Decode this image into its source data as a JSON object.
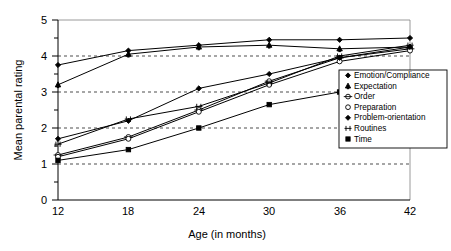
{
  "chart_data": {
    "type": "line",
    "title": "",
    "xlabel": "Age (in months)",
    "ylabel": "Mean parental rating",
    "categories": [
      12,
      18,
      24,
      30,
      36,
      42
    ],
    "x": [
      12,
      18,
      24,
      30,
      36,
      42
    ],
    "xlim": [
      12,
      42
    ],
    "ylim": [
      0,
      5
    ],
    "y_ticks": [
      0,
      1,
      2,
      3,
      4,
      5
    ],
    "y_minor_tick_step": 0.5,
    "x_ticks": [
      12,
      18,
      24,
      30,
      36,
      42
    ],
    "gridlines": "horizontal dashed at 1, 2, 3, 4",
    "grid": true,
    "legend_position": "right",
    "series": [
      {
        "name": "Emotion/Compliance",
        "marker": "filled-diamond",
        "values": [
          3.75,
          4.15,
          4.3,
          4.45,
          4.45,
          4.5
        ]
      },
      {
        "name": "Expectation",
        "marker": "filled-club",
        "values": [
          3.2,
          4.05,
          4.25,
          4.3,
          4.2,
          4.25
        ]
      },
      {
        "name": "Order",
        "marker": "open-circle-barred",
        "values": [
          1.25,
          1.75,
          2.5,
          3.3,
          3.95,
          4.2
        ]
      },
      {
        "name": "Preparation",
        "marker": "open-circle",
        "values": [
          1.2,
          1.7,
          2.45,
          3.2,
          3.85,
          4.15
        ]
      },
      {
        "name": "Problem-orientation",
        "marker": "filled-diamond",
        "values": [
          1.7,
          2.2,
          3.1,
          3.5,
          3.95,
          4.25
        ]
      },
      {
        "name": "Routines",
        "marker": "cross-bar",
        "values": [
          1.55,
          2.25,
          2.6,
          3.25,
          4.0,
          4.3
        ]
      },
      {
        "name": "Time",
        "marker": "filled-square",
        "values": [
          1.1,
          1.4,
          2.0,
          2.65,
          3.0,
          3.5
        ]
      }
    ]
  },
  "axes": {
    "y_labels": [
      "5",
      "4",
      "3",
      "2",
      "1",
      "0"
    ],
    "x_labels": [
      "12",
      "18",
      "24",
      "30",
      "36",
      "42"
    ],
    "y_title": "Mean parental rating",
    "x_title": "Age (in months)"
  },
  "legend": {
    "items": [
      {
        "label": "Emotion/Compliance",
        "marker": "filled-diamond"
      },
      {
        "label": "Expectation",
        "marker": "filled-club"
      },
      {
        "label": "Order",
        "marker": "open-circle-barred"
      },
      {
        "label": "Preparation",
        "marker": "open-circle"
      },
      {
        "label": "Problem-orientation",
        "marker": "filled-diamond"
      },
      {
        "label": "Routines",
        "marker": "cross-bar"
      },
      {
        "label": "Time",
        "marker": "filled-square"
      }
    ]
  },
  "colors": {
    "line": "#000000",
    "grid": "#000000",
    "frame": "#808080",
    "background": "#ffffff"
  }
}
